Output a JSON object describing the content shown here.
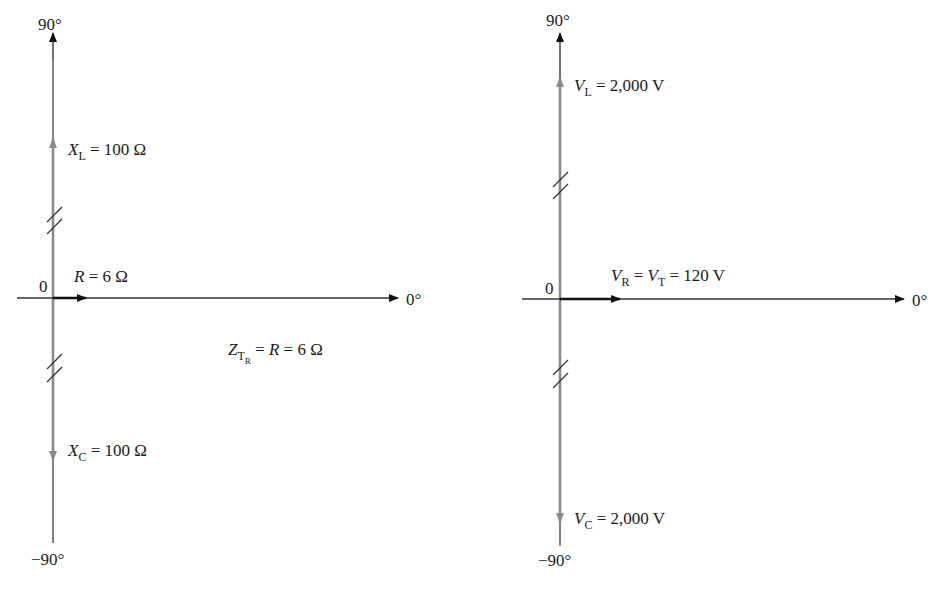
{
  "diagrams": [
    {
      "id": "impedance",
      "axis_labels": {
        "top": "90°",
        "bottom": "−90°",
        "right": "0°",
        "origin": "0"
      },
      "vectors": {
        "up": {
          "sym": "X",
          "sub": "L",
          "rest": " = 100 Ω"
        },
        "right": {
          "sym": "R",
          "rest": " = 6 Ω"
        },
        "down": {
          "sym": "X",
          "sub": "C",
          "rest": " = 100 Ω"
        }
      },
      "total": {
        "sym": "Z",
        "sub": "T",
        "subsub": "R",
        "rest": " = ",
        "sym2": "R",
        "rest2": " = 6 Ω"
      }
    },
    {
      "id": "voltage",
      "axis_labels": {
        "top": "90°",
        "bottom": "−90°",
        "right": "0°",
        "origin": "0"
      },
      "vectors": {
        "up": {
          "sym": "V",
          "sub": "L",
          "rest": " = 2,000 V"
        },
        "right": {
          "sym": "V",
          "sub": "R",
          "mid": " = ",
          "sym2": "V",
          "sub2": "T",
          "rest": " = 120 V"
        },
        "down": {
          "sym": "V",
          "sub": "C",
          "rest": " = 2,000 V"
        }
      }
    }
  ],
  "colors": {
    "axis": "#222222",
    "reactive": "#8a8a8a",
    "resistive": "#111111"
  }
}
